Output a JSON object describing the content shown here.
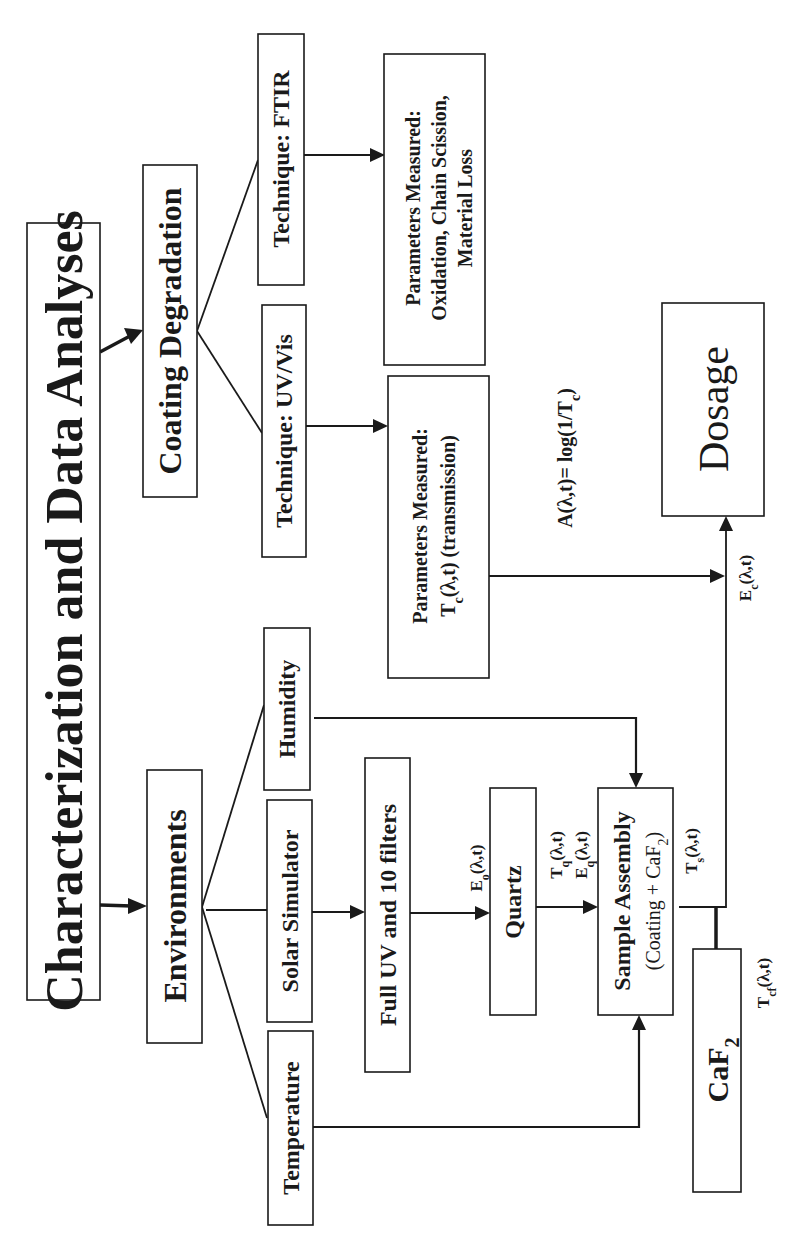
{
  "diagram": {
    "title": "Characterization and Data Analyses",
    "nodes": {
      "coating_degradation": "Coating Degradation",
      "environments": "Environments",
      "technique_ftir": "Technique: FTIR",
      "technique_uvvis": "Technique: UV/Vis",
      "params_ftir": {
        "line1": "Parameters Measured:",
        "line2": "Oxidation, Chain Scission,",
        "line3": "Material Loss"
      },
      "params_uvvis": {
        "line1": "Parameters Measured:",
        "line2_main": "T",
        "line2_sub": "c",
        "line2_rest": "(λ,t) (transmission)"
      },
      "humidity": "Humidity",
      "solar_simulator": "Solar Simulator",
      "temperature": "Temperature",
      "full_uv": "Full UV and 10 filters",
      "quartz": "Quartz",
      "sample_assembly": {
        "line1": "Sample Assembly",
        "line2_pre": "(Coating + CaF",
        "line2_sub": "2",
        "line2_post": ")"
      },
      "caf2": {
        "main": "CaF",
        "sub": "2"
      },
      "dosage": "Dosage"
    },
    "labels": {
      "formula": {
        "pre": "A(λ,t)= log(1/T",
        "sub": "c",
        "post": ")"
      },
      "e_o": {
        "main": "E",
        "sub": "o",
        "rest": "(λ,t)"
      },
      "t_q": {
        "main": "T",
        "sub": "q",
        "rest": "(λ,t)"
      },
      "e_q": {
        "main": "E",
        "sub": "q",
        "rest": "(λ,t)"
      },
      "t_s": {
        "main": "T",
        "sub": "s",
        "rest": "(λ,t)"
      },
      "t_cf": {
        "main": "T",
        "sub": "cf",
        "rest": "(λ,t)"
      },
      "e_c": {
        "main": "E",
        "sub": "c",
        "rest": "(λ,t)"
      }
    }
  }
}
